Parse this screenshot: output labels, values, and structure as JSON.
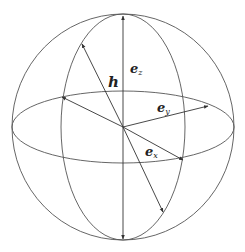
{
  "diagram": {
    "stroke_color": "#555555",
    "labels": {
      "h": {
        "main": "h",
        "sub": ""
      },
      "ez": {
        "main": "e",
        "sub": "z"
      },
      "ey": {
        "main": "e",
        "sub": "y"
      },
      "ex": {
        "main": "e",
        "sub": "x"
      }
    }
  }
}
